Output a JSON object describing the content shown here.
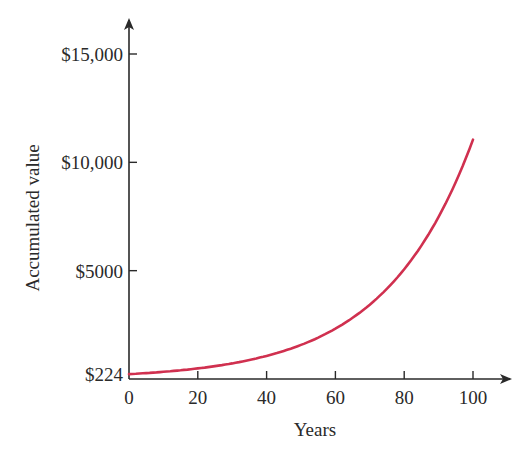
{
  "chart_data": {
    "type": "line",
    "title": "",
    "xlabel": "Years",
    "ylabel": "Accumulated value",
    "xlim": [
      0,
      100
    ],
    "ylim": [
      0,
      15000
    ],
    "grid": false,
    "legend": null,
    "x_ticks": [
      0,
      20,
      40,
      60,
      80,
      100
    ],
    "x_tick_labels": [
      "0",
      "20",
      "40",
      "60",
      "80",
      "100"
    ],
    "y_ticks": [
      224,
      5000,
      10000,
      15000
    ],
    "y_tick_labels": [
      "$224",
      "$5000",
      "$10,000",
      "$15,000"
    ],
    "series": [
      {
        "name": "Accumulated value",
        "color": "#d0304f",
        "x": [
          0,
          10,
          20,
          30,
          40,
          50,
          60,
          70,
          80,
          90,
          100
        ],
        "values": [
          224,
          330,
          490,
          720,
          1070,
          1570,
          2320,
          3430,
          5060,
          7480,
          11050
        ]
      }
    ]
  },
  "colors": {
    "axis": "#2a2a2a",
    "curve": "#d0304f",
    "background": "#ffffff"
  }
}
